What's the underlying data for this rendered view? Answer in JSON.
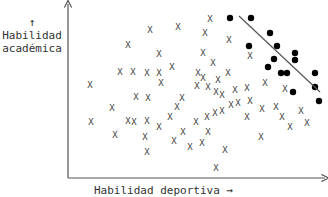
{
  "chart_data": {
    "type": "scatter",
    "title": "",
    "xlabel": "Habilidad deportiva →",
    "ylabel_arrow": "↑",
    "ylabel_line1": "Habilidad",
    "ylabel_line2": "académica",
    "grid": false,
    "legend": null,
    "axis_px": {
      "x0": 68,
      "y0": 178,
      "x1": 326,
      "y1": 3
    },
    "series": [
      {
        "name": "no admitidos",
        "marker": "X",
        "color": "#444444",
        "points_px": [
          [
            90,
            85
          ],
          [
            128,
            45
          ],
          [
            150,
            30
          ],
          [
            178,
            27
          ],
          [
            203,
            53
          ],
          [
            159,
            54
          ],
          [
            120,
            72
          ],
          [
            133,
            72
          ],
          [
            147,
            73
          ],
          [
            159,
            73
          ],
          [
            172,
            67
          ],
          [
            161,
            83
          ],
          [
            198,
            73
          ],
          [
            203,
            78
          ],
          [
            213,
            63
          ],
          [
            205,
            33
          ],
          [
            210,
            19
          ],
          [
            229,
            40
          ],
          [
            250,
            56
          ],
          [
            197,
            86
          ],
          [
            208,
            87
          ],
          [
            218,
            80
          ],
          [
            228,
            73
          ],
          [
            216,
            92
          ],
          [
            222,
            95
          ],
          [
            235,
            90
          ],
          [
            247,
            88
          ],
          [
            265,
            83
          ],
          [
            238,
            103
          ],
          [
            250,
            101
          ],
          [
            262,
            109
          ],
          [
            285,
            89
          ],
          [
            301,
            111
          ],
          [
            215,
            113
          ],
          [
            231,
            105
          ],
          [
            276,
            107
          ],
          [
            136,
            97
          ],
          [
            148,
            98
          ],
          [
            182,
            98
          ],
          [
            177,
            107
          ],
          [
            147,
            121
          ],
          [
            159,
            127
          ],
          [
            170,
            117
          ],
          [
            207,
            117
          ],
          [
            222,
            111
          ],
          [
            196,
            122
          ],
          [
            183,
            132
          ],
          [
            208,
            132
          ],
          [
            174,
            141
          ],
          [
            190,
            147
          ],
          [
            202,
            143
          ],
          [
            134,
            122
          ],
          [
            112,
            108
          ],
          [
            128,
            121
          ],
          [
            91,
            122
          ],
          [
            115,
            135
          ],
          [
            147,
            152
          ],
          [
            225,
            150
          ],
          [
            216,
            168
          ],
          [
            145,
            137
          ],
          [
            247,
            117
          ],
          [
            261,
            137
          ],
          [
            282,
            117
          ],
          [
            290,
            127
          ],
          [
            307,
            123
          ]
        ]
      },
      {
        "name": "admitidos",
        "marker": "filled-circle",
        "color": "#000000",
        "points_px": [
          [
            230,
            18
          ],
          [
            251,
            18
          ],
          [
            270,
            33
          ],
          [
            249,
            46
          ],
          [
            277,
            46
          ],
          [
            295,
            53
          ],
          [
            295,
            60
          ],
          [
            274,
            59
          ],
          [
            268,
            67
          ],
          [
            281,
            73
          ],
          [
            287,
            73
          ],
          [
            315,
            73
          ],
          [
            315,
            87
          ],
          [
            293,
            92
          ],
          [
            319,
            101
          ]
        ]
      }
    ],
    "annotations": [
      {
        "type": "line",
        "from_px": [
          239,
          16
        ],
        "to_px": [
          320,
          92
        ],
        "color": "#555555",
        "meaning": "umbral de admisión"
      }
    ]
  }
}
